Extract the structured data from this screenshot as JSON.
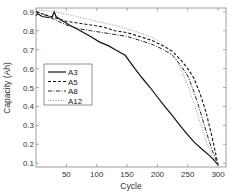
{
  "chart_data": {
    "type": "line",
    "title": "",
    "xlabel": "Cycle",
    "ylabel": "Capacity (Ah)",
    "xlim": [
      0,
      313
    ],
    "ylim": [
      0.08,
      0.92
    ],
    "xticks": [
      50,
      100,
      150,
      200,
      250,
      300
    ],
    "yticks": [
      0.1,
      0.2,
      0.3,
      0.4,
      0.5,
      0.6,
      0.7,
      0.8,
      0.9
    ],
    "xtick_labels": [
      "50",
      "100",
      "150",
      "200",
      "250",
      "300"
    ],
    "ytick_labels": [
      "0.1",
      "0.2",
      "0.3",
      "0.4",
      "0.5",
      "0.6",
      "0.7",
      "0.8",
      "0.9"
    ],
    "grid": false,
    "legend_position": "center-left",
    "series": [
      {
        "name": "A3",
        "style": "solid",
        "x": [
          0,
          3,
          10,
          20,
          27,
          30,
          33,
          40,
          55,
          73,
          90,
          105,
          120,
          130,
          147,
          163,
          175,
          188,
          200,
          212,
          225,
          237,
          250,
          261,
          275,
          286,
          295,
          300
        ],
        "y": [
          0.88,
          0.89,
          0.875,
          0.87,
          0.875,
          0.9,
          0.875,
          0.86,
          0.83,
          0.8,
          0.77,
          0.74,
          0.72,
          0.7,
          0.67,
          0.6,
          0.55,
          0.5,
          0.45,
          0.4,
          0.35,
          0.3,
          0.25,
          0.21,
          0.17,
          0.14,
          0.11,
          0.09
        ]
      },
      {
        "name": "A5",
        "style": "dashed",
        "x": [
          0,
          10,
          30,
          50,
          70,
          90,
          110,
          130,
          150,
          170,
          190,
          210,
          225,
          240,
          250,
          260,
          270,
          280,
          290,
          300
        ],
        "y": [
          0.9,
          0.89,
          0.87,
          0.85,
          0.84,
          0.83,
          0.82,
          0.8,
          0.79,
          0.77,
          0.75,
          0.72,
          0.69,
          0.64,
          0.6,
          0.55,
          0.47,
          0.37,
          0.24,
          0.09
        ]
      },
      {
        "name": "A8",
        "style": "dashdot",
        "x": [
          0,
          10,
          30,
          50,
          70,
          90,
          110,
          130,
          150,
          170,
          190,
          210,
          225,
          240,
          250,
          260,
          270,
          280,
          290,
          300
        ],
        "y": [
          0.9,
          0.89,
          0.86,
          0.83,
          0.81,
          0.8,
          0.79,
          0.78,
          0.77,
          0.75,
          0.73,
          0.7,
          0.67,
          0.61,
          0.56,
          0.48,
          0.38,
          0.27,
          0.17,
          0.09
        ]
      },
      {
        "name": "A12",
        "style": "dotted",
        "x": [
          0,
          20,
          40,
          60,
          80,
          100,
          120,
          140,
          160,
          180,
          200,
          215,
          230,
          240,
          250,
          260,
          270,
          280,
          290,
          300
        ],
        "y": [
          0.91,
          0.905,
          0.895,
          0.88,
          0.865,
          0.85,
          0.835,
          0.82,
          0.8,
          0.78,
          0.75,
          0.71,
          0.65,
          0.59,
          0.51,
          0.42,
          0.32,
          0.22,
          0.14,
          0.09
        ]
      }
    ]
  }
}
